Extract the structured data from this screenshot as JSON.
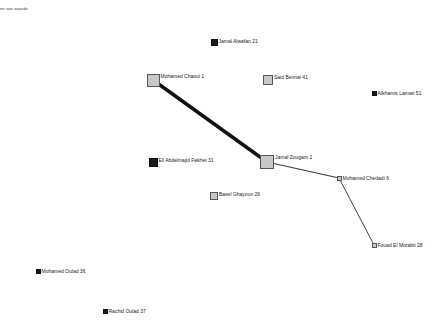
{
  "caption": "ter van waarde",
  "nodes": [
    {
      "id": "jamal-alwafan",
      "label": "Jamal Alwafan 21",
      "x": 214,
      "y": 42,
      "size": 7,
      "style": "black"
    },
    {
      "id": "mohamed-chaoui",
      "label": "Mohamed Chaoui 1",
      "x": 153,
      "y": 80,
      "size": 13,
      "style": "gray"
    },
    {
      "id": "said-bennai",
      "label": "Said Bennai 41",
      "x": 268,
      "y": 80,
      "size": 10,
      "style": "gray"
    },
    {
      "id": "alkhamis-lamari",
      "label": "Alkhamis Lamari 51",
      "x": 374,
      "y": 93,
      "size": 5,
      "style": "black"
    },
    {
      "id": "ell-abdelmajid-fakhet",
      "label": "Ell Abdelmajid Fakhet 31",
      "x": 153,
      "y": 162,
      "size": 9,
      "style": "black"
    },
    {
      "id": "jamal-zougam",
      "label": "Jamal Zougam 1",
      "x": 267,
      "y": 162,
      "size": 14,
      "style": "gray"
    },
    {
      "id": "mohamed-chedadi",
      "label": "Mohamed Chedadi 6",
      "x": 339,
      "y": 178,
      "size": 5,
      "style": "gray"
    },
    {
      "id": "basel-ghayoun",
      "label": "Basel Ghayoun 26",
      "x": 214,
      "y": 196,
      "size": 8,
      "style": "gray"
    },
    {
      "id": "fouad-el-morabit",
      "label": "Fouad El Morabit 28",
      "x": 374,
      "y": 245,
      "size": 5,
      "style": "gray"
    },
    {
      "id": "mohamed-oulad",
      "label": "Mohamed Oulad 36",
      "x": 38,
      "y": 271,
      "size": 5,
      "style": "black"
    },
    {
      "id": "rachid-oulad",
      "label": "Rachid Oulad 37",
      "x": 105,
      "y": 311,
      "size": 5,
      "style": "black"
    }
  ],
  "edges": [
    {
      "from": "mohamed-chaoui",
      "to": "jamal-zougam",
      "width": 3.5,
      "color": "#111111"
    },
    {
      "from": "jamal-zougam",
      "to": "mohamed-chedadi",
      "width": 1,
      "color": "#333333"
    },
    {
      "from": "mohamed-chedadi",
      "to": "fouad-el-morabit",
      "width": 1,
      "color": "#444444"
    }
  ]
}
